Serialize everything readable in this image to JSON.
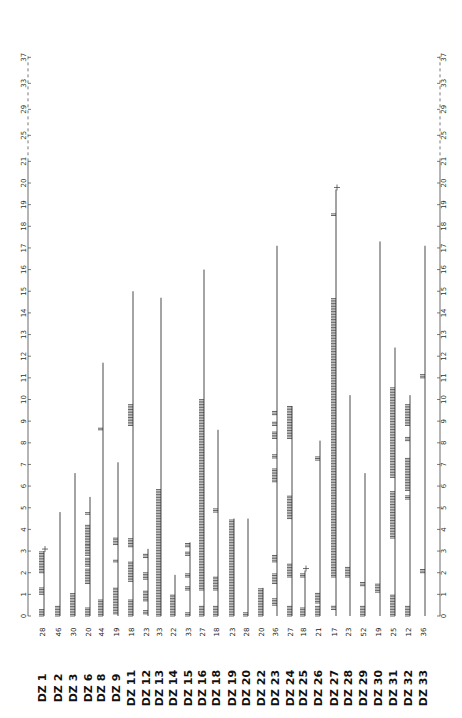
{
  "chart_data": {
    "type": "bar",
    "orientation": "rotated-90",
    "title": "",
    "xlabel": "",
    "ylabel": "",
    "axis": {
      "linear_ticks": [
        0,
        1,
        2,
        3,
        4,
        5,
        6,
        7,
        8,
        9,
        10,
        11,
        12,
        13,
        14,
        15,
        16,
        17,
        18,
        19,
        20,
        21
      ],
      "broken_ticks": [
        25,
        29,
        33,
        37
      ],
      "ylim": [
        0,
        37
      ],
      "break_after": 21
    },
    "categories": [
      "DZ 1",
      "DZ 2",
      "DZ 3",
      "DZ 6",
      "DZ 8",
      "DZ 9",
      "DZ 11",
      "DZ 12",
      "DZ 13",
      "DZ 14",
      "DZ 15",
      "DZ 16",
      "DZ 18",
      "DZ 19",
      "DZ 20",
      "DZ 22",
      "DZ 23",
      "DZ 24",
      "DZ 25",
      "DZ 26",
      "DZ 27",
      "DZ 28",
      "DZ 29",
      "DZ 30",
      "DZ 31",
      "DZ 32",
      "DZ 33"
    ],
    "counts": [
      28,
      46,
      30,
      20,
      44,
      19,
      18,
      23,
      33,
      22,
      33,
      27,
      18,
      23,
      28,
      20,
      36,
      27,
      18,
      21,
      17,
      23,
      52,
      19,
      25,
      12,
      36
    ],
    "values": [
      3.0,
      4.8,
      6.6,
      5.5,
      11.7,
      7.1,
      15.0,
      3.1,
      14.7,
      1.9,
      3.4,
      16.0,
      8.6,
      4.5,
      4.5,
      1.3,
      17.1,
      9.7,
      2.1,
      8.1,
      19.7,
      10.2,
      6.6,
      17.3,
      12.4,
      10.2,
      17.1
    ],
    "terminal_cross": [
      true,
      false,
      false,
      false,
      false,
      false,
      false,
      false,
      false,
      false,
      false,
      false,
      false,
      false,
      false,
      false,
      false,
      false,
      true,
      false,
      true,
      false,
      false,
      false,
      false,
      false,
      false
    ],
    "hatched_segments": [
      [
        [
          0,
          0.35
        ],
        [
          1.0,
          1.35
        ],
        [
          2.0,
          3.0
        ]
      ],
      [
        [
          0,
          0.5
        ]
      ],
      [
        [
          0,
          1.1
        ]
      ],
      [
        [
          0,
          0.4
        ],
        [
          1.5,
          2.2
        ],
        [
          2.3,
          2.7
        ],
        [
          2.8,
          3.3
        ],
        [
          3.3,
          4.2
        ],
        [
          4.7,
          4.8
        ]
      ],
      [
        [
          0,
          0.75
        ],
        [
          8.6,
          8.7
        ]
      ],
      [
        [
          0.1,
          1.3
        ],
        [
          2.5,
          2.6
        ],
        [
          3.3,
          3.6
        ]
      ],
      [
        [
          0,
          0.8
        ],
        [
          1.6,
          2.5
        ],
        [
          3.2,
          3.6
        ],
        [
          8.8,
          9.8
        ]
      ],
      [
        [
          0.1,
          0.3
        ],
        [
          0.7,
          1.2
        ],
        [
          1.7,
          2.0
        ],
        [
          2.7,
          2.9
        ]
      ],
      [
        [
          0,
          5.9
        ]
      ],
      [
        [
          0,
          1.0
        ]
      ],
      [
        [
          0,
          0.2
        ],
        [
          1.2,
          1.4
        ],
        [
          1.8,
          2.0
        ],
        [
          2.8,
          3.0
        ],
        [
          3.2,
          3.4
        ]
      ],
      [
        [
          0,
          0.5
        ],
        [
          1.2,
          10.0
        ]
      ],
      [
        [
          0,
          0.5
        ],
        [
          1.2,
          1.8
        ],
        [
          4.8,
          5.0
        ]
      ],
      [
        [
          0,
          4.5
        ]
      ],
      [
        [
          0,
          0.2
        ]
      ],
      [
        [
          0,
          1.3
        ]
      ],
      [
        [
          0.5,
          0.8
        ],
        [
          1.5,
          2.0
        ],
        [
          2.5,
          2.8
        ],
        [
          6.2,
          6.8
        ],
        [
          7.3,
          7.5
        ],
        [
          8.2,
          8.5
        ],
        [
          8.8,
          9.0
        ],
        [
          9.3,
          9.5
        ]
      ],
      [
        [
          0,
          0.5
        ],
        [
          1.8,
          2.4
        ],
        [
          4.5,
          5.6
        ],
        [
          8.2,
          9.7
        ]
      ],
      [
        [
          0,
          0.4
        ],
        [
          1.8,
          2.0
        ]
      ],
      [
        [
          0,
          0.5
        ],
        [
          0.6,
          1.1
        ],
        [
          7.2,
          7.4
        ]
      ],
      [
        [
          0.3,
          0.5
        ],
        [
          1.8,
          14.7
        ],
        [
          18.5,
          18.6
        ]
      ],
      [
        [
          1.8,
          2.3
        ]
      ],
      [
        [
          0,
          0.5
        ],
        [
          1.4,
          1.6
        ]
      ],
      [
        [
          1.1,
          1.5
        ]
      ],
      [
        [
          0,
          1.0
        ],
        [
          3.6,
          5.8
        ],
        [
          6.4,
          10.6
        ]
      ],
      [
        [
          0,
          0.5
        ],
        [
          5.4,
          5.6
        ],
        [
          5.8,
          7.3
        ],
        [
          8.1,
          8.3
        ],
        [
          8.8,
          9.8
        ]
      ],
      [
        [
          2.0,
          2.2
        ],
        [
          11.0,
          11.2
        ]
      ]
    ],
    "legend": null,
    "grid": false
  },
  "labels": {
    "prefix": "DZ"
  }
}
